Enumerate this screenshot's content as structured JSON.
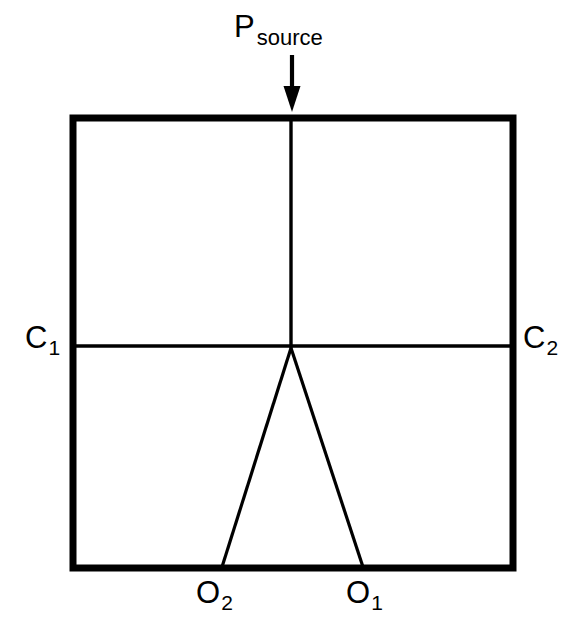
{
  "figure": {
    "type": "line-diagram",
    "background_color": "#ffffff",
    "stroke_color": "#000000"
  },
  "labels": {
    "source": {
      "base": "P",
      "sub": "source"
    },
    "c1": {
      "base": "C",
      "sub": "1"
    },
    "c2": {
      "base": "C",
      "sub": "2"
    },
    "o1": {
      "base": "O",
      "sub": "1"
    },
    "o2": {
      "base": "O",
      "sub": "2"
    }
  },
  "geometry": {
    "box": {
      "left": 73,
      "top": 118,
      "right": 513,
      "bottom": 568,
      "stroke_width": 7
    },
    "vertical_line": {
      "x": 291,
      "y_top": 118,
      "y_bottom": 348,
      "stroke_width": 3
    },
    "horizontal_line": {
      "y": 346,
      "x_left": 73,
      "x_right": 513,
      "stroke_width": 3
    },
    "wedge": {
      "apex": {
        "x": 291,
        "y": 348
      },
      "left_foot": {
        "x": 222,
        "y": 566
      },
      "right_foot": {
        "x": 363,
        "y": 566
      },
      "stroke_width": 3
    },
    "arrow": {
      "x": 292,
      "y_top": 55,
      "y_tip": 110,
      "stroke_width": 4,
      "head_width": 15,
      "head_height": 22
    }
  }
}
